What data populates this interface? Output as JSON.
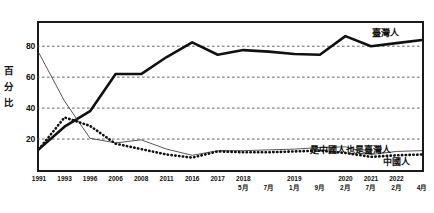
{
  "chart_data": {
    "type": "line",
    "title": "",
    "xlabel": "",
    "ylabel": "百分比",
    "ylim": [
      0,
      95
    ],
    "yticks": [
      20,
      40,
      60,
      80
    ],
    "grid": true,
    "legend_position": "inline-right",
    "categories": [
      "1991",
      "1993",
      "1996",
      "2006",
      "2008",
      "2011",
      "2016",
      "2017",
      "2018\n5月",
      "7月",
      "2019\n1月",
      "9月",
      "2020\n2月",
      "2021\n7月",
      "2022\n2月",
      "4月"
    ],
    "x_labels": [
      {
        "year": "1991",
        "month": ""
      },
      {
        "year": "1993",
        "month": ""
      },
      {
        "year": "1996",
        "month": ""
      },
      {
        "year": "2006",
        "month": ""
      },
      {
        "year": "2008",
        "month": ""
      },
      {
        "year": "2011",
        "month": ""
      },
      {
        "year": "2016",
        "month": ""
      },
      {
        "year": "2017",
        "month": ""
      },
      {
        "year": "2018",
        "month": "5月"
      },
      {
        "year": "",
        "month": "7月"
      },
      {
        "year": "2019",
        "month": "1月"
      },
      {
        "year": "",
        "month": "9月"
      },
      {
        "year": "2020",
        "month": "2月"
      },
      {
        "year": "2021",
        "month": "7月"
      },
      {
        "year": "2022",
        "month": "2月"
      },
      {
        "year": "",
        "month": "4月"
      }
    ],
    "series": [
      {
        "name": "臺灣人",
        "style": "thick-solid",
        "color": "#111111",
        "values": [
          13.5,
          28,
          38,
          62,
          62,
          73,
          82.5,
          74.5,
          77.5,
          76.5,
          75,
          74.5,
          86.5,
          80,
          82,
          84
        ]
      },
      {
        "name": "是中國人也是臺灣人",
        "style": "thin-solid",
        "color": "#444444",
        "values": [
          75.5,
          44.5,
          20.5,
          17.5,
          19.5,
          13.5,
          9.5,
          12.5,
          12.5,
          13,
          13.5,
          14.5,
          15,
          10,
          12,
          12.5
        ]
      },
      {
        "name": "中國人",
        "style": "thick-dotted",
        "color": "#111111",
        "values": [
          13.5,
          34,
          28.5,
          17,
          13.5,
          10,
          8,
          12,
          11.5,
          11.5,
          12,
          12.5,
          11,
          8.5,
          9.5,
          10
        ]
      }
    ],
    "series_labels": {
      "taiwanese": "臺灣人",
      "both": "是中國人也是臺灣人",
      "chinese": "中國人"
    }
  }
}
